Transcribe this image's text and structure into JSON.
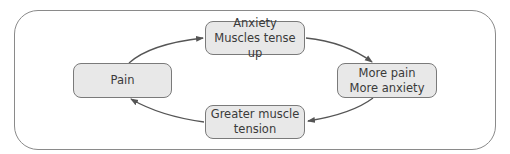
{
  "diagram": {
    "type": "cycle",
    "nodes": [
      {
        "id": "pain",
        "lines": [
          "Pain"
        ]
      },
      {
        "id": "anxiety",
        "lines": [
          "Anxiety",
          "Muscles tense up"
        ]
      },
      {
        "id": "more-pain",
        "lines": [
          "More pain",
          "More anxiety"
        ]
      },
      {
        "id": "greater-tension",
        "lines": [
          "Greater muscle",
          "tension"
        ]
      }
    ],
    "edges": [
      {
        "from": "pain",
        "to": "anxiety"
      },
      {
        "from": "anxiety",
        "to": "more-pain"
      },
      {
        "from": "more-pain",
        "to": "greater-tension"
      },
      {
        "from": "greater-tension",
        "to": "pain"
      }
    ],
    "colors": {
      "node_fill": "#e8e8e8",
      "node_border": "#7a7a7a",
      "arrow": "#555555",
      "frame": "#8a8a8a"
    }
  }
}
